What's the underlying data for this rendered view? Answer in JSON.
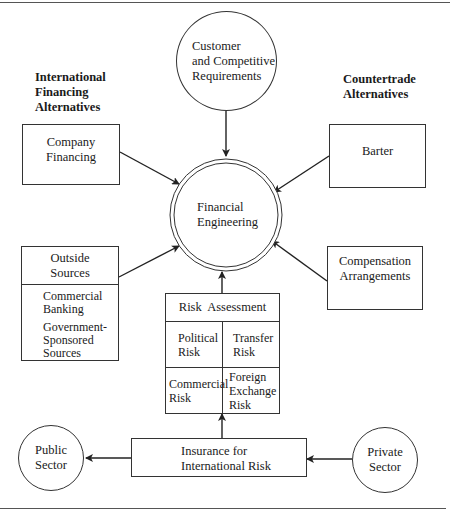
{
  "headings": {
    "left": "International Financing Alternatives",
    "left_lines": [
      "International",
      "Financing",
      "Alternatives"
    ],
    "right_lines": [
      "Countertrade",
      "Alternatives"
    ]
  },
  "nodes": {
    "customer": {
      "lines": [
        "Customer",
        "and Competitive",
        "Requirements"
      ]
    },
    "financial_engineering": {
      "lines": [
        "Financial",
        "Engineering"
      ]
    },
    "company_financing": {
      "lines": [
        "Company",
        "Financing"
      ]
    },
    "barter": {
      "label": "Barter"
    },
    "outside_sources": {
      "title_lines": [
        "Outside",
        "Sources"
      ],
      "items": [
        {
          "lines": [
            "Commercial",
            "Banking"
          ]
        },
        {
          "lines": [
            "Government-",
            "Sponsored",
            "Sources"
          ]
        }
      ]
    },
    "compensation": {
      "lines": [
        "Compensation",
        "Arrangements"
      ]
    },
    "risk_assessment": {
      "title": "Risk Assessment",
      "cells": [
        {
          "lines": [
            "Political",
            "Risk"
          ]
        },
        {
          "lines": [
            "Transfer",
            "Risk"
          ]
        },
        {
          "lines": [
            "Commercial",
            "Risk"
          ]
        },
        {
          "lines": [
            "Foreign",
            "Exchange",
            "Risk"
          ]
        }
      ]
    },
    "insurance": {
      "lines": [
        "Insurance for",
        "International Risk"
      ]
    },
    "public_sector": {
      "lines": [
        "Public",
        "Sector"
      ]
    },
    "private_sector": {
      "lines": [
        "Private",
        "Sector"
      ]
    }
  },
  "edges": [
    {
      "from": "customer",
      "to": "financial_engineering"
    },
    {
      "from": "company_financing",
      "to": "financial_engineering"
    },
    {
      "from": "barter",
      "to": "financial_engineering"
    },
    {
      "from": "outside_sources",
      "to": "financial_engineering"
    },
    {
      "from": "compensation",
      "to": "financial_engineering"
    },
    {
      "from": "risk_assessment",
      "to": "financial_engineering"
    },
    {
      "from": "insurance",
      "to": "risk_assessment"
    },
    {
      "from": "insurance",
      "to": "public_sector"
    },
    {
      "from": "private_sector",
      "to": "insurance"
    }
  ],
  "colors": {
    "line": "#333333",
    "text": "#1a1a1a",
    "background": "#ffffff"
  }
}
